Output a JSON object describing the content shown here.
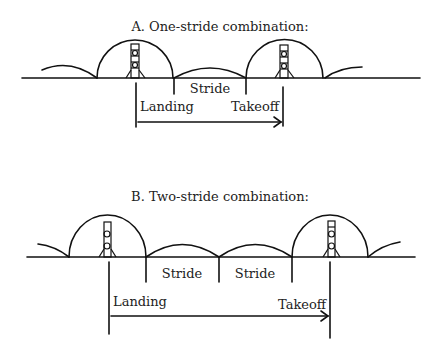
{
  "diagram": {
    "panel_a": {
      "title": "A. One-stride combination:",
      "labels": {
        "stride": "Stride",
        "landing": "Landing",
        "takeoff": "Takeoff"
      },
      "stride_count": 1
    },
    "panel_b": {
      "title": "B. Two-stride combination:",
      "labels": {
        "stride_1": "Stride",
        "stride_2": "Stride",
        "landing": "Landing",
        "takeoff": "Takeoff"
      },
      "stride_count": 2
    },
    "colors": {
      "ink": "#111111",
      "background": "#ffffff"
    }
  }
}
